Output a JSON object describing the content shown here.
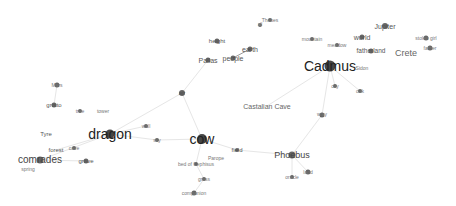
{
  "graph": {
    "background": "#ffffff",
    "node_color": "#333333",
    "edge_color": "#e6e6e6",
    "nodes": [
      {
        "id": "dragon",
        "label": "dragon",
        "x": 110,
        "y": 134,
        "r": 4.5,
        "size": 14,
        "color": "#222222"
      },
      {
        "id": "cow",
        "label": "cow",
        "x": 202,
        "y": 139,
        "r": 5,
        "size": 14,
        "color": "#222222"
      },
      {
        "id": "cadmus",
        "label": "Cadmus",
        "x": 330,
        "y": 66,
        "r": 5.5,
        "size": 14,
        "color": "#222222"
      },
      {
        "id": "comrades",
        "label": "comrades",
        "x": 40,
        "y": 160,
        "r": 3.5,
        "size": 10,
        "color": "#444444"
      },
      {
        "id": "phoebus",
        "label": "Phoebus",
        "x": 292,
        "y": 155,
        "r": 3.5,
        "size": 9,
        "color": "#444444"
      },
      {
        "id": "crete",
        "label": "Crete",
        "x": 406,
        "y": 53,
        "r": 0,
        "size": 9,
        "color": "#666666"
      },
      {
        "id": "castalian-cave",
        "label": "Castalian Cave",
        "x": 267,
        "y": 106,
        "r": 0,
        "size": 7,
        "color": "#666666"
      },
      {
        "id": "jupiter",
        "label": "Jupiter",
        "x": 385,
        "y": 26,
        "r": 3,
        "size": 7,
        "color": "#555555"
      },
      {
        "id": "world",
        "label": "world",
        "x": 362,
        "y": 37,
        "r": 2.5,
        "size": 7,
        "color": "#555555"
      },
      {
        "id": "fatherland",
        "label": "fatherland",
        "x": 371,
        "y": 51,
        "r": 2.5,
        "size": 6.5,
        "color": "#555555"
      },
      {
        "id": "mountain",
        "label": "mountain",
        "x": 312,
        "y": 39,
        "r": 2,
        "size": 5,
        "color": "#777777"
      },
      {
        "id": "meadow",
        "label": "meadow",
        "x": 337,
        "y": 45,
        "r": 2,
        "size": 5,
        "color": "#777777"
      },
      {
        "id": "stolen-girl",
        "label": "stolen girl",
        "x": 426,
        "y": 38,
        "r": 2.5,
        "size": 5,
        "color": "#777777"
      },
      {
        "id": "father",
        "label": "father",
        "x": 430,
        "y": 48,
        "r": 2.5,
        "size": 5,
        "color": "#777777"
      },
      {
        "id": "sidon",
        "label": "Sidon",
        "x": 362,
        "y": 68,
        "r": 0,
        "size": 5,
        "color": "#777777"
      },
      {
        "id": "city",
        "label": "city",
        "x": 335,
        "y": 86,
        "r": 2,
        "size": 5,
        "color": "#777777"
      },
      {
        "id": "oak",
        "label": "oak",
        "x": 360,
        "y": 91,
        "r": 2,
        "size": 5,
        "color": "#777777"
      },
      {
        "id": "way",
        "label": "way",
        "x": 322,
        "y": 115,
        "r": 2.5,
        "size": 5.5,
        "color": "#777777"
      },
      {
        "id": "thebes",
        "label": "Thebes",
        "x": 270,
        "y": 20,
        "r": 2,
        "size": 5,
        "color": "#777777"
      },
      {
        "id": "all",
        "label": "all",
        "x": 260,
        "y": 25,
        "r": 2,
        "size": 4.5,
        "color": "#888888"
      },
      {
        "id": "height",
        "label": "height",
        "x": 217,
        "y": 41,
        "r": 2.5,
        "size": 6,
        "color": "#555555"
      },
      {
        "id": "earth",
        "label": "earth",
        "x": 250,
        "y": 49,
        "r": 2.5,
        "size": 7,
        "color": "#555555"
      },
      {
        "id": "people",
        "label": "people",
        "x": 233,
        "y": 58,
        "r": 2.5,
        "size": 7,
        "color": "#555555"
      },
      {
        "id": "pallas",
        "label": "Pallas",
        "x": 208,
        "y": 60,
        "r": 2.5,
        "size": 7,
        "color": "#555555"
      },
      {
        "id": "air",
        "label": "air",
        "x": 182,
        "y": 93,
        "r": 3,
        "size": 6,
        "color": "#555555"
      },
      {
        "id": "wall",
        "label": "wall",
        "x": 146,
        "y": 126,
        "r": 2,
        "size": 5,
        "color": "#777777"
      },
      {
        "id": "sky",
        "label": "sky",
        "x": 157,
        "y": 140,
        "r": 2,
        "size": 5,
        "color": "#777777"
      },
      {
        "id": "field",
        "label": "field",
        "x": 237,
        "y": 150,
        "r": 2,
        "size": 6,
        "color": "#555555"
      },
      {
        "id": "parope",
        "label": "Parope",
        "x": 216,
        "y": 158,
        "r": 0,
        "size": 5,
        "color": "#777777"
      },
      {
        "id": "bed-of-cephisus",
        "label": "bed of Cephisus",
        "x": 196,
        "y": 164,
        "r": 2,
        "size": 5,
        "color": "#777777"
      },
      {
        "id": "grass",
        "label": "grass",
        "x": 204,
        "y": 179,
        "r": 2,
        "size": 5,
        "color": "#777777"
      },
      {
        "id": "companion",
        "label": "companion",
        "x": 194,
        "y": 193,
        "r": 2.5,
        "size": 5,
        "color": "#777777"
      },
      {
        "id": "oracle",
        "label": "oracle",
        "x": 292,
        "y": 177,
        "r": 2,
        "size": 5,
        "color": "#777777"
      },
      {
        "id": "land",
        "label": "land",
        "x": 308,
        "y": 172,
        "r": 2.5,
        "size": 5,
        "color": "#777777"
      },
      {
        "id": "mars",
        "label": "Mars",
        "x": 57,
        "y": 85,
        "r": 2.5,
        "size": 5,
        "color": "#777777"
      },
      {
        "id": "grotto",
        "label": "grotto",
        "x": 54,
        "y": 105,
        "r": 2.5,
        "size": 6,
        "color": "#555555"
      },
      {
        "id": "tree",
        "label": "tree",
        "x": 80,
        "y": 111,
        "r": 2,
        "size": 5,
        "color": "#777777"
      },
      {
        "id": "tower",
        "label": "tower",
        "x": 103,
        "y": 111,
        "r": 0,
        "size": 5,
        "color": "#777777"
      },
      {
        "id": "tyre",
        "label": "Tyre",
        "x": 46,
        "y": 134,
        "r": 0,
        "size": 6,
        "color": "#555555"
      },
      {
        "id": "forest",
        "label": "forest",
        "x": 56,
        "y": 150,
        "r": 0,
        "size": 6,
        "color": "#555555"
      },
      {
        "id": "cave",
        "label": "cave",
        "x": 74,
        "y": 148,
        "r": 2,
        "size": 5,
        "color": "#777777"
      },
      {
        "id": "grove",
        "label": "grove",
        "x": 86,
        "y": 161,
        "r": 2.5,
        "size": 6,
        "color": "#555555"
      },
      {
        "id": "spring",
        "label": "spring",
        "x": 28,
        "y": 169,
        "r": 0,
        "size": 5,
        "color": "#777777"
      }
    ],
    "edges": [
      {
        "from": "dragon",
        "to": "air"
      },
      {
        "from": "dragon",
        "to": "sky"
      },
      {
        "from": "dragon",
        "to": "wall"
      },
      {
        "from": "dragon",
        "to": "comrades"
      },
      {
        "from": "dragon",
        "to": "forest"
      },
      {
        "from": "cow",
        "to": "air"
      },
      {
        "from": "cow",
        "to": "field"
      },
      {
        "from": "cow",
        "to": "sky"
      },
      {
        "from": "cow",
        "to": "bed-of-cephisus"
      },
      {
        "from": "field",
        "to": "phoebus"
      },
      {
        "from": "air",
        "to": "pallas"
      },
      {
        "from": "people",
        "to": "earth",
        "dark": true
      },
      {
        "from": "cadmus",
        "to": "castalian-cave"
      },
      {
        "from": "cadmus",
        "to": "city"
      },
      {
        "from": "cadmus",
        "to": "oak"
      },
      {
        "from": "cadmus",
        "to": "way"
      },
      {
        "from": "way",
        "to": "phoebus"
      },
      {
        "from": "phoebus",
        "to": "oracle"
      },
      {
        "from": "phoebus",
        "to": "land"
      },
      {
        "from": "comrades",
        "to": "grove"
      },
      {
        "from": "mars",
        "to": "grotto"
      },
      {
        "from": "bed-of-cephisus",
        "to": "grass"
      },
      {
        "from": "grass",
        "to": "companion"
      }
    ]
  }
}
